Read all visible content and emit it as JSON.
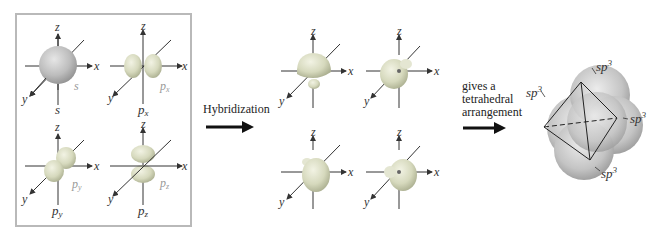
{
  "figure": {
    "left_panel": {
      "orbitals": [
        {
          "name": "s",
          "inner_label": "s",
          "below_label": "s"
        },
        {
          "name": "px",
          "inner_label": "px",
          "below_label": "px"
        },
        {
          "name": "py",
          "inner_label": "py",
          "below_label": "py"
        },
        {
          "name": "pz",
          "inner_label": "pz",
          "below_label": "pz"
        }
      ],
      "axes": {
        "x": "x",
        "y": "y",
        "z": "z"
      }
    },
    "hybridization_step": {
      "label": "Hybridization"
    },
    "middle_panel": {
      "orbitals": [
        {
          "name": "sp3-1"
        },
        {
          "name": "sp3-2"
        },
        {
          "name": "sp3-3"
        },
        {
          "name": "sp3-4"
        }
      ],
      "axes": {
        "x": "x",
        "y": "y",
        "z": "z"
      }
    },
    "result_step": {
      "line1": "gives a",
      "line2": "tetrahedral",
      "line3": "arrangement"
    },
    "tetrahedron": {
      "labels": [
        "sp3",
        "sp3",
        "sp3",
        "sp3"
      ],
      "label_base": "sp",
      "label_sup": "3"
    },
    "colors": {
      "orbital_gray": "#b8b8b8",
      "orbital_green_tint": "#d8dcc0",
      "panel_border": "#b9b9b9",
      "axis": "#333333"
    }
  }
}
